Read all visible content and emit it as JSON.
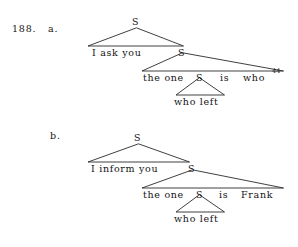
{
  "figure": {
    "number_label": "188.",
    "examples": [
      {
        "id": "a",
        "item_label": "a.",
        "nodes": {
          "root": "S",
          "embedded": "S",
          "inner": "S",
          "deepest": "S"
        },
        "terminals": {
          "matrix_clause": "I ask you",
          "subject": "the one",
          "copula": "is",
          "predicate": "who",
          "relative_clause": "who left"
        },
        "footnote_marker": "44"
      },
      {
        "id": "b",
        "item_label": "b.",
        "nodes": {
          "root": "S",
          "embedded": "S",
          "inner": "S",
          "deepest": "S"
        },
        "terminals": {
          "matrix_clause": "I inform you",
          "subject": "the one",
          "copula": "is",
          "predicate": "Frank",
          "relative_clause": "who left"
        },
        "footnote_marker": ""
      }
    ],
    "colors": {
      "ink": "#141414",
      "line": "#2a2a2a",
      "background": "#ffffff"
    }
  }
}
